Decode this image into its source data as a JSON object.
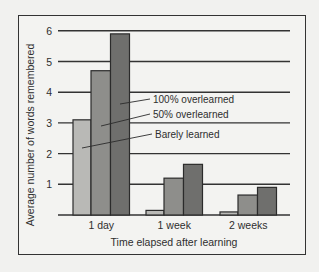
{
  "chart_data": {
    "type": "bar",
    "title": "",
    "xlabel": "Time elapsed after learning",
    "ylabel": "Average number of words remembered",
    "categories": [
      "1 day",
      "1 week",
      "2 weeks"
    ],
    "series": [
      {
        "name": "Barely learned",
        "values": [
          3.1,
          0.15,
          0.1
        ],
        "color": "#b9b9b6"
      },
      {
        "name": "50% overlearned",
        "values": [
          4.7,
          1.2,
          0.65
        ],
        "color": "#8e8e8b"
      },
      {
        "name": "100% overlearned",
        "values": [
          5.9,
          1.65,
          0.9
        ],
        "color": "#6f6f6d"
      }
    ],
    "yticks": [
      "1",
      "2",
      "3",
      "4",
      "5",
      "6"
    ],
    "ylim": [
      0,
      6
    ],
    "grid": true,
    "legend_position": "inline annotations pointing to 1 day bars"
  },
  "labels": {
    "annotation_100": "100% overlearned",
    "annotation_50": "50% overlearned",
    "annotation_barely": "Barely learned"
  }
}
